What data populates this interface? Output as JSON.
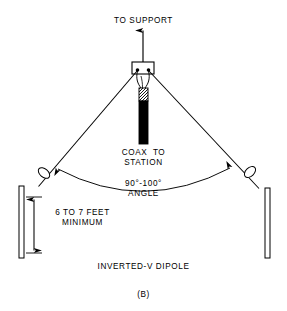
{
  "figure": {
    "panel_letter": "(B)",
    "title": "INVERTED-V DIPOLE",
    "background_color": "#ffffff",
    "line_color": "#000000"
  },
  "labels": {
    "to_support": "TO SUPPORT",
    "coax_to_station": "COAX  TO\nSTATION",
    "angle": "90°-100°\nANGLE",
    "height": "6 TO 7 FEET\nMINIMUM"
  },
  "diagram": {
    "apex_insulator": {
      "name": "center-insulator-block",
      "x": 132,
      "y": 62,
      "width": 22,
      "height": 12,
      "terminal_dots": 2
    },
    "support_arrow": {
      "name": "to-support-arrow",
      "from_y": 62,
      "to_y": 28,
      "x": 143,
      "direction": "up"
    },
    "legs": [
      {
        "name": "left-antenna-leg",
        "x1": 137,
        "y1": 72,
        "x2": 38,
        "y2": 186
      },
      {
        "name": "right-antenna-leg",
        "x1": 149,
        "y1": 72,
        "x2": 259,
        "y2": 188
      }
    ],
    "egg_insulators": [
      {
        "name": "left-egg-insulator",
        "cx": 44,
        "cy": 173,
        "rx": 4.2,
        "ry": 6.5,
        "rotation": -49
      },
      {
        "name": "right-egg-insulator",
        "cx": 250,
        "cy": 172,
        "rx": 4.2,
        "ry": 6.5,
        "rotation": 46
      }
    ],
    "posts": [
      {
        "name": "left-support-post",
        "x": 19,
        "y": 186,
        "width": 5,
        "height": 72
      },
      {
        "name": "right-support-post",
        "x": 265,
        "y": 188,
        "width": 5,
        "height": 70
      }
    ],
    "coax": {
      "name": "coax-cable",
      "x": 139,
      "braid_top": 88,
      "braid_bottom": 101,
      "jacket_bottom": 144,
      "width": 9
    },
    "angle_arc": {
      "name": "angle-arc",
      "start": [
        56,
        167
      ],
      "end": [
        232,
        167
      ],
      "control": [
        143,
        215
      ],
      "arrowheads": "both-ends"
    },
    "dimension": {
      "name": "height-dimension",
      "x": 33,
      "top_y": 197,
      "bottom_y": 253,
      "tick_width": 14,
      "arrowheads": "both-ends"
    }
  }
}
